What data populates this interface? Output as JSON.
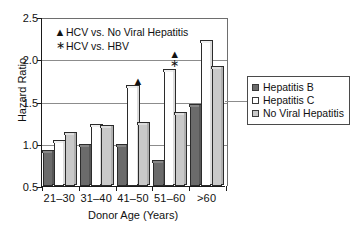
{
  "chart_data": {
    "type": "bar",
    "title": "",
    "xlabel": "Donor Age (Years)",
    "ylabel": "Hazard Ratio",
    "categories": [
      "21‒30",
      "31‒40",
      "41‒50",
      "51‒60",
      ">60"
    ],
    "series": [
      {
        "name": "Hepatitis B",
        "color": "#6b6b6b",
        "values": [
          0.9,
          0.97,
          0.97,
          0.78,
          1.45
        ]
      },
      {
        "name": "Hepatitis C",
        "color": "#ffffff",
        "values": [
          1.02,
          1.21,
          1.67,
          1.86,
          2.2
        ]
      },
      {
        "name": "No Viral Hepatitis",
        "color": "#c9c9c9",
        "values": [
          1.11,
          1.2,
          1.23,
          1.35,
          1.9
        ]
      }
    ],
    "ylim": [
      0.5,
      2.5
    ],
    "yticks": [
      0.5,
      1.0,
      1.5,
      2.0,
      2.5
    ],
    "ytick_labels": [
      "0.5",
      "1.0",
      "1.5",
      "2.0",
      "2.5"
    ],
    "grid": true,
    "legend_position": "right-outside",
    "annotations": [
      {
        "symbol": "▲",
        "label": "HCV vs. No Viral Hepatitis"
      },
      {
        "symbol": "∗",
        "label": "HCV vs. HBV"
      }
    ],
    "significance_markers": [
      {
        "category": "41‒50",
        "symbol": "▲",
        "value": 1.75,
        "meaning": "HCV vs. No Viral Hepatitis"
      },
      {
        "category": "51‒60",
        "symbol": "▲",
        "value": 2.07,
        "meaning": "HCV vs. No Viral Hepatitis"
      },
      {
        "category": "51‒60",
        "symbol": "∗",
        "value": 1.97,
        "meaning": "HCV vs. HBV"
      }
    ]
  }
}
